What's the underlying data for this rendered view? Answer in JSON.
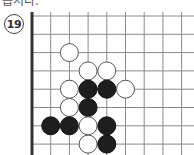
{
  "header": {
    "clipped_text": "봅시다."
  },
  "problem": {
    "number": "19"
  },
  "board": {
    "origin_x": 32,
    "origin_y": 16,
    "spacing_x": 18.7,
    "spacing_y": 18.3,
    "columns": 9,
    "rows": 8,
    "left_edge": true,
    "line_color": "#8a8a8a",
    "edge_color": "#333333",
    "stone_radius": 9,
    "stones": [
      {
        "color": "white",
        "col": 2,
        "row": 2
      },
      {
        "color": "white",
        "col": 3,
        "row": 3
      },
      {
        "color": "white",
        "col": 4,
        "row": 3
      },
      {
        "color": "white",
        "col": 2,
        "row": 4
      },
      {
        "color": "black",
        "col": 3,
        "row": 4
      },
      {
        "color": "black",
        "col": 4,
        "row": 4
      },
      {
        "color": "white",
        "col": 5,
        "row": 4
      },
      {
        "color": "white",
        "col": 2,
        "row": 5
      },
      {
        "color": "black",
        "col": 3,
        "row": 5
      },
      {
        "color": "black",
        "col": 1,
        "row": 6
      },
      {
        "color": "black",
        "col": 2,
        "row": 6
      },
      {
        "color": "white",
        "col": 3,
        "row": 6
      },
      {
        "color": "black",
        "col": 4,
        "row": 6
      },
      {
        "color": "white",
        "col": 3,
        "row": 7
      },
      {
        "color": "black",
        "col": 4,
        "row": 7
      }
    ]
  }
}
